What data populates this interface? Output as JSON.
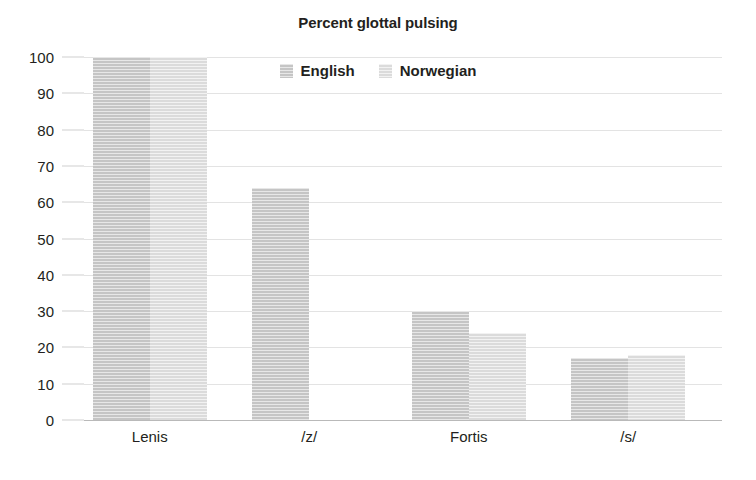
{
  "chart_data": {
    "type": "bar",
    "title": "Percent glottal pulsing",
    "xlabel": "",
    "ylabel": "",
    "ylim": [
      0,
      100
    ],
    "yticks": [
      0,
      10,
      20,
      30,
      40,
      50,
      60,
      70,
      80,
      90,
      100
    ],
    "ytick_labels": [
      "0",
      "10",
      "20",
      "30",
      "40",
      "50",
      "60",
      "70",
      "80",
      "90",
      "100"
    ],
    "categories": [
      "Lenis",
      "/z/",
      "Fortis",
      "/s/"
    ],
    "grid": true,
    "legend_position": "top-center",
    "series": [
      {
        "name": "English",
        "color": "#c9c9c9",
        "values": [
          100,
          64,
          30,
          17
        ]
      },
      {
        "name": "Norwegian",
        "color": "#dedede",
        "values": [
          100,
          0,
          24,
          18
        ]
      }
    ]
  },
  "legend": {
    "items": [
      {
        "label": "English",
        "swatch": "legend-swatch-english"
      },
      {
        "label": "Norwegian",
        "swatch": "legend-swatch-norwegian"
      }
    ]
  }
}
